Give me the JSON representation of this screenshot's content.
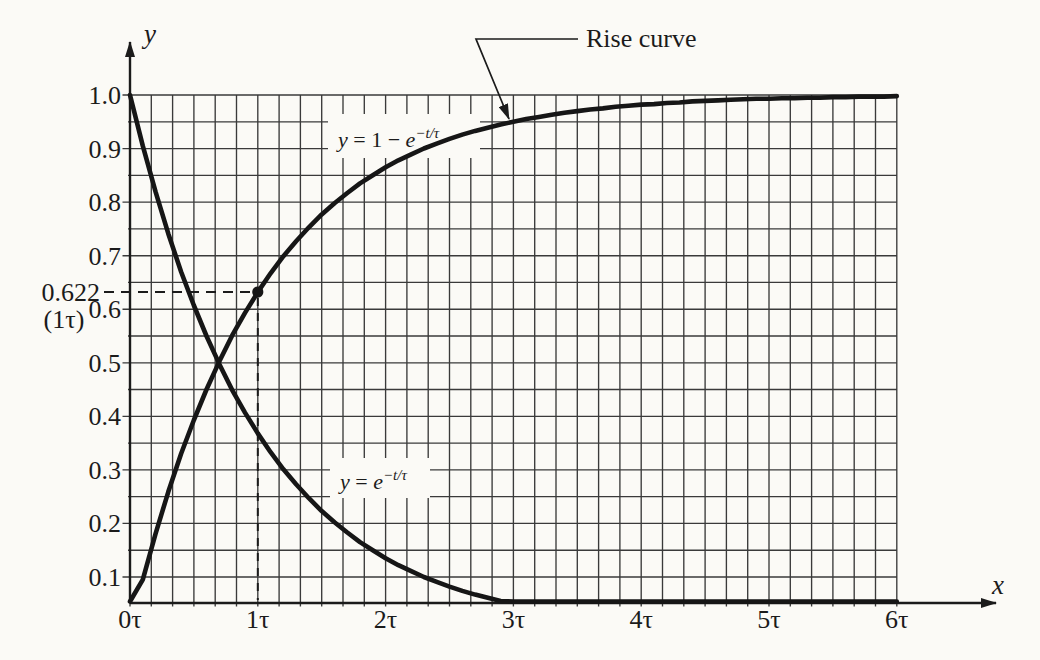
{
  "figure": {
    "y_axis_letter": "y",
    "x_axis_letter": "x",
    "y_ticks": [
      "1.0",
      "0.9",
      "0.8",
      "0.7",
      "0.6",
      "0.5",
      "0.4",
      "0.3",
      "0.2",
      "0.1"
    ],
    "x_ticks": [
      "0τ",
      "1τ",
      "2τ",
      "3τ",
      "4τ",
      "5τ",
      "6τ"
    ],
    "annotation": {
      "value_label": "0.622",
      "tau_label": "(1τ)",
      "callout": "Rise curve"
    },
    "equations": {
      "rise": {
        "var": "y",
        "mid": " = 1 − ",
        "base": "e",
        "sup": "−t/τ"
      },
      "decay": {
        "var": "y",
        "mid": " = ",
        "base": "e",
        "sup": "−t/τ"
      }
    }
  },
  "chart_data": {
    "type": "line",
    "title": "",
    "xlabel": "x (time in units of τ)",
    "ylabel": "y",
    "xlim": [
      0,
      6
    ],
    "ylim": [
      0,
      1
    ],
    "x_unit": "τ",
    "x_start": 0,
    "x_step": 0.1,
    "x_major_ticks": [
      0,
      1,
      2,
      3,
      4,
      5,
      6
    ],
    "y_major_ticks": [
      1.0,
      0.9,
      0.8,
      0.7,
      0.6,
      0.5,
      0.4,
      0.3,
      0.2,
      0.1
    ],
    "grid": true,
    "minor_grid_divisions_per_x_unit": 6,
    "minor_grid_y_step": 0.05,
    "legend_position": "none",
    "series": [
      {
        "name": "rise",
        "equation": "y = 1 − e^(−t/τ)",
        "values": [
          0.0,
          0.095,
          0.181,
          0.259,
          0.33,
          0.393,
          0.451,
          0.503,
          0.551,
          0.593,
          0.632,
          0.667,
          0.699,
          0.727,
          0.753,
          0.777,
          0.798,
          0.817,
          0.835,
          0.85,
          0.865,
          0.878,
          0.889,
          0.9,
          0.909,
          0.918,
          0.926,
          0.933,
          0.939,
          0.945,
          0.95,
          0.955,
          0.959,
          0.963,
          0.967,
          0.97,
          0.973,
          0.975,
          0.978,
          0.98,
          0.982,
          0.983,
          0.985,
          0.986,
          0.988,
          0.989,
          0.99,
          0.991,
          0.992,
          0.993,
          0.993,
          0.994,
          0.994,
          0.995,
          0.995,
          0.996,
          0.996,
          0.997,
          0.997,
          0.997,
          0.998
        ]
      },
      {
        "name": "decay",
        "equation": "y = e^(−t/τ)",
        "values": [
          1.0,
          0.905,
          0.819,
          0.741,
          0.67,
          0.607,
          0.549,
          0.497,
          0.449,
          0.407,
          0.368,
          0.333,
          0.301,
          0.273,
          0.247,
          0.223,
          0.202,
          0.183,
          0.165,
          0.15,
          0.135,
          0.122,
          0.111,
          0.1,
          0.091,
          0.082,
          0.074,
          0.067,
          0.061,
          0.055,
          0.05,
          0.045,
          0.041,
          0.037,
          0.033,
          0.03,
          0.027,
          0.025,
          0.022,
          0.02,
          0.018,
          0.017,
          0.015,
          0.014,
          0.012,
          0.011,
          0.01,
          0.009,
          0.008,
          0.007,
          0.007,
          0.006,
          0.006,
          0.005,
          0.005,
          0.004,
          0.004,
          0.003,
          0.003,
          0.003,
          0.002
        ]
      }
    ],
    "annotations": {
      "marked_point": {
        "x": 1,
        "y": 0.632,
        "marker": "filled-dot"
      },
      "value_label": "0.622",
      "value_sub_label": "(1τ)",
      "callout_label": "Rise curve",
      "dashed_guides": [
        "horizontal from y-label to point",
        "vertical from point to x-axis"
      ]
    }
  }
}
